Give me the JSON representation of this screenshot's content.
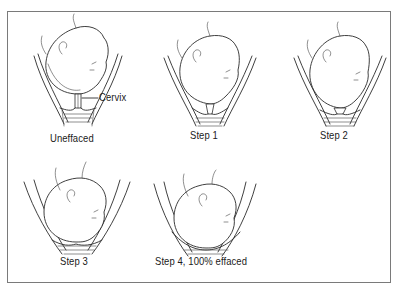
{
  "figure": {
    "panels": [
      {
        "id": "uneffaced",
        "label": "Uneffaced",
        "callout": "Cervix",
        "effacement": 0
      },
      {
        "id": "step1",
        "label": "Step 1",
        "effacement": 25
      },
      {
        "id": "step2",
        "label": "Step 2",
        "effacement": 50
      },
      {
        "id": "step3",
        "label": "Step 3",
        "effacement": 75
      },
      {
        "id": "step4",
        "label": "Step 4, 100% effaced",
        "effacement": 100
      }
    ]
  },
  "colors": {
    "line": "#2a2a2a",
    "frame": "#7a7a7a",
    "background": "#ffffff"
  }
}
